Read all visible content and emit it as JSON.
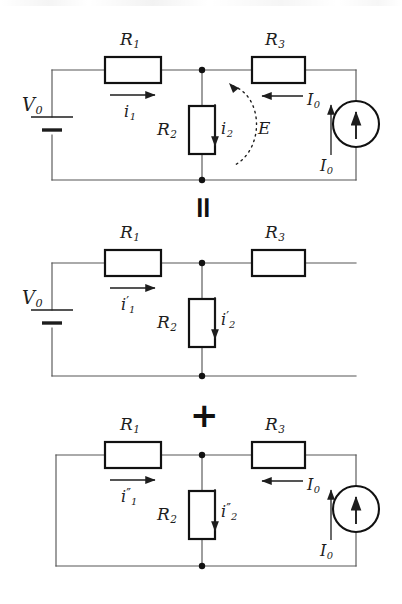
{
  "figure": {
    "type": "circuit-diagram",
    "topic": "superposition-theorem"
  },
  "operators": {
    "equals": "=",
    "plus": "+"
  },
  "circuits": [
    {
      "id": "original",
      "labels": {
        "source_voltage": "V",
        "source_voltage_sub": "0",
        "r1": "R",
        "r1_sub": "1",
        "r2": "R",
        "r2_sub": "2",
        "r3": "R",
        "r3_sub": "3",
        "i1": "i",
        "i1_sub": "1",
        "i1_prime": "",
        "i2": "i",
        "i2_sub": "2",
        "i2_prime": "",
        "mesh": "E",
        "i0_branch": "I",
        "i0_branch_sub": "0",
        "i0_source": "I",
        "i0_source_sub": "0"
      },
      "elements": {
        "voltage_source": "battery",
        "current_source": "circle-with-up-arrow",
        "mesh_loop": "dotted-ccw-arc"
      }
    },
    {
      "id": "voltage-source-only",
      "labels": {
        "source_voltage": "V",
        "source_voltage_sub": "0",
        "r1": "R",
        "r1_sub": "1",
        "r2": "R",
        "r2_sub": "2",
        "r3": "R",
        "r3_sub": "3",
        "i1": "i",
        "i1_sub": "1",
        "i1_prime": "′",
        "i2": "i",
        "i2_sub": "2",
        "i2_prime": "′"
      },
      "elements": {
        "voltage_source": "battery",
        "current_source": "open-circuit"
      }
    },
    {
      "id": "current-source-only",
      "labels": {
        "r1": "R",
        "r1_sub": "1",
        "r2": "R",
        "r2_sub": "2",
        "r3": "R",
        "r3_sub": "3",
        "i1": "i",
        "i1_sub": "1",
        "i1_prime": "″",
        "i2": "i",
        "i2_sub": "2",
        "i2_prime": "″",
        "i0_branch": "I",
        "i0_branch_sub": "0",
        "i0_source": "I",
        "i0_source_sub": "0"
      },
      "elements": {
        "voltage_source": "short-circuit",
        "current_source": "circle-with-up-arrow"
      }
    }
  ],
  "colors": {
    "ink": "#1d1d1d",
    "wire": "#4a4a4a",
    "component_outline": "#111111",
    "background": "#ffffff"
  }
}
